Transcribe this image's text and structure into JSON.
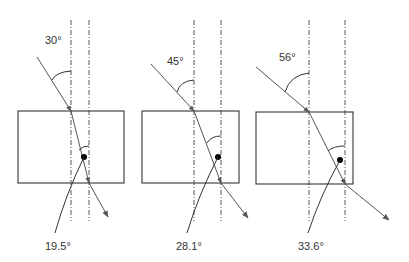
{
  "diagram": {
    "type": "refraction-through-slab",
    "panels": [
      {
        "incident_angle_label": "30°",
        "refracted_angle_label": "19.5°",
        "block": {
          "x": 18,
          "y": 111,
          "w": 106,
          "h": 72
        },
        "normal_entry_x": 71,
        "normal_exit_x": 89,
        "incident_start": [
          37,
          57
        ],
        "entry_point": [
          71,
          111
        ],
        "exit_point": [
          89,
          183
        ],
        "exit_tip": [
          108,
          217
        ],
        "dot": [
          84,
          157
        ],
        "label_in": [
          45,
          44
        ],
        "label_out": [
          45,
          250
        ],
        "leader_end": [
          55,
          233
        ],
        "arc_in": "M52,80 Q56,72 71,71",
        "arc_out": "M79,150 Q82,146 89,146"
      },
      {
        "incident_angle_label": "45°",
        "refracted_angle_label": "28.1°",
        "block": {
          "x": 142,
          "y": 111,
          "w": 97,
          "h": 72
        },
        "normal_entry_x": 194,
        "normal_exit_x": 221,
        "incident_start": [
          151,
          64
        ],
        "entry_point": [
          194,
          111
        ],
        "exit_point": [
          221,
          183
        ],
        "exit_tip": [
          248,
          218
        ],
        "dot": [
          218,
          157
        ],
        "label_in": [
          167,
          65
        ],
        "label_out": [
          176,
          250
        ],
        "leader_end": [
          187,
          233
        ],
        "arc_in": "M177,92 Q180,81 194,80",
        "arc_out": "M207,143 Q211,136 221,136"
      },
      {
        "incident_angle_label": "56°",
        "refracted_angle_label": "33.6°",
        "block": {
          "x": 256,
          "y": 112,
          "w": 97,
          "h": 72
        },
        "normal_entry_x": 309,
        "normal_exit_x": 345,
        "incident_start": [
          256,
          67
        ],
        "entry_point": [
          309,
          112
        ],
        "exit_point": [
          345,
          184
        ],
        "exit_tip": [
          389,
          220
        ],
        "dot": [
          340,
          160
        ],
        "label_in": [
          279,
          61
        ],
        "label_out": [
          298,
          250
        ],
        "leader_end": [
          308,
          233
        ],
        "arc_in": "M285,92 Q290,75 309,73",
        "arc_out": "M328,151 Q333,146 345,146"
      }
    ],
    "normal_top_y": 20,
    "normal_bottom_y": 221,
    "colors": {
      "ray": "#555555",
      "outline": "#333333",
      "normal": "#444444",
      "dot": "#000000",
      "text": "#333333"
    }
  }
}
